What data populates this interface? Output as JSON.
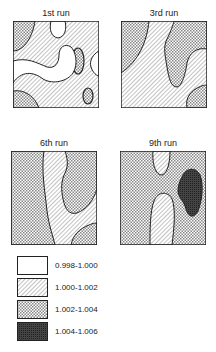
{
  "panels": [
    {
      "title": "1st run"
    },
    {
      "title": "3rd run"
    },
    {
      "title": "6th run"
    },
    {
      "title": "9th run"
    }
  ],
  "legend": [
    {
      "label": "0.998-1.000",
      "fill": "white"
    },
    {
      "label": "1.000-1.002",
      "fill": "diagonal-hatch"
    },
    {
      "label": "1.002-1.004",
      "fill": "cross-hatch"
    },
    {
      "label": "1.004-1.006",
      "fill": "dense-dark"
    }
  ],
  "colors": {
    "line": "#222222",
    "dark": "#333333"
  }
}
